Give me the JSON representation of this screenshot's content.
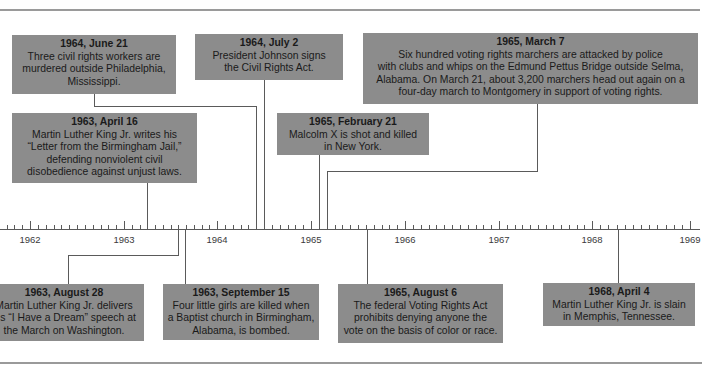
{
  "timeline": {
    "axis": {
      "years": [
        "1962",
        "1963",
        "1964",
        "1965",
        "1966",
        "1967",
        "1968",
        "1969"
      ],
      "year_x": [
        30,
        124,
        217,
        311,
        405,
        499,
        592,
        690
      ],
      "axis_y": 229,
      "axis_start_x": 0,
      "axis_end_x": 700
    },
    "colors": {
      "box": "#8c8c8c",
      "text": "#1a1a1a",
      "line": "#5a5a5a",
      "rule": "#9a9a9a"
    },
    "events": [
      {
        "id": "1964-06-21",
        "date": "1964, June 21",
        "description": "Three civil rights workers are\nmurdered outside Philadelphia,\nMississippi.",
        "position": "above"
      },
      {
        "id": "1964-07-02",
        "date": "1964, July 2",
        "description": "President Johnson signs\nthe Civil Rights Act.",
        "position": "above"
      },
      {
        "id": "1965-03-07",
        "date": "1965, March 7",
        "description": "Six hundred voting rights marchers are attacked by police\nwith clubs and whips on the Edmund Pettus Bridge outside Selma,\nAlabama. On March 21, about 3,200 marchers head out again on a\nfour-day march to Montgomery in support of voting rights.",
        "position": "above"
      },
      {
        "id": "1963-04-16",
        "date": "1963, April 16",
        "description": "Martin Luther King Jr. writes his\n“Letter from the Birmingham Jail,”\ndefending nonviolent civil\ndisobedience against unjust laws.",
        "position": "above"
      },
      {
        "id": "1965-02-21",
        "date": "1965, February 21",
        "description": "Malcolm X is shot and killed\nin New York.",
        "position": "above"
      },
      {
        "id": "1963-08-28",
        "date": "1963, August 28",
        "description": "Martin Luther King Jr. delivers\nhis “I Have a Dream” speech at\nthe March on Washington.",
        "position": "below"
      },
      {
        "id": "1963-09-15",
        "date": "1963, September 15",
        "description": "Four little girls are killed when\na Baptist church in Birmingham,\nAlabama, is bombed.",
        "position": "below"
      },
      {
        "id": "1965-08-06",
        "date": "1965, August 6",
        "description": "The federal Voting Rights Act\nprohibits denying anyone the\nvote on the basis of color or race.",
        "position": "below"
      },
      {
        "id": "1968-04-04",
        "date": "1968, April 4",
        "description": "Martin Luther King Jr. is slain\nin Memphis, Tennessee.",
        "position": "below"
      }
    ]
  }
}
